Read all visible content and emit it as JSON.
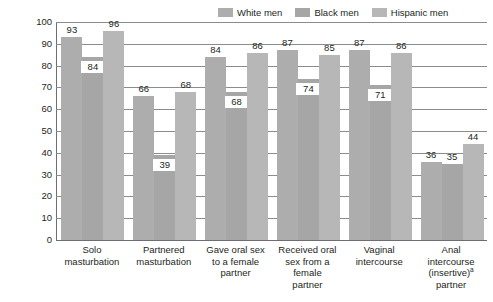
{
  "chart_data": {
    "type": "bar",
    "title": "",
    "xlabel": "",
    "ylabel": "Percentage of men aged 18–39 who had ever participated in behavior",
    "ylim": [
      0,
      100
    ],
    "yticks": [
      "0",
      "10",
      "20",
      "30",
      "40",
      "50",
      "60",
      "70",
      "80",
      "90",
      "100"
    ],
    "grid": true,
    "legend_position": "top-right",
    "categories": [
      "Solo masturbation",
      "Partnered masturbation",
      "Gave oral sex to a female partner",
      "Received oral sex from a female partner",
      "Vaginal intercourse",
      "Anal intercourse (insertive) partner"
    ],
    "category_lines": [
      [
        "Solo",
        "masturbation"
      ],
      [
        "Partnered",
        "masturbation"
      ],
      [
        "Gave oral sex",
        "to a female",
        "partner"
      ],
      [
        "Received oral",
        "sex from a",
        "female",
        "partner"
      ],
      [
        "Vaginal",
        "intercourse"
      ],
      [
        "Anal",
        "intercourse",
        "(insertive)",
        "partner"
      ]
    ],
    "footnote_marker": "a",
    "series": [
      {
        "name": "White men",
        "color": "#adadad",
        "values": [
          93,
          66,
          84,
          87,
          87,
          36
        ]
      },
      {
        "name": "Black men",
        "color": "#a6a6a6",
        "values": [
          84,
          39,
          68,
          74,
          71,
          35
        ]
      },
      {
        "name": "Hispanic men",
        "color": "#b7b7b7",
        "values": [
          96,
          68,
          86,
          85,
          86,
          44
        ]
      }
    ]
  },
  "legend": {
    "items": [
      {
        "label": "White men"
      },
      {
        "label": "Black men"
      },
      {
        "label": "Hispanic men"
      }
    ]
  }
}
